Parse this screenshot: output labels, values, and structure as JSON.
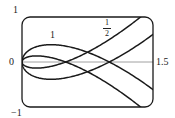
{
  "chart_data": {
    "type": "line",
    "title": "",
    "xlabel": "",
    "ylabel": "",
    "xlim": [
      0,
      1.5
    ],
    "ylim": [
      -1,
      1
    ],
    "grid": false,
    "axis_tick_labels": {
      "y_top": "1",
      "y_bottom": "-1",
      "x_left": "0",
      "x_right": "1.5"
    },
    "parametric_form": "x = t^2, y = t^3 - c t",
    "series": [
      {
        "name": "1",
        "c": 1,
        "label_text": "1",
        "x_axis_crossing": 1.0
      },
      {
        "name": "1/2",
        "c": 0.5,
        "label_text": "1/2",
        "label_num": "1",
        "label_den": "2",
        "x_axis_crossing": 0.5
      }
    ],
    "line_color": "#1a1a1a",
    "axis_color": "#888888"
  },
  "labels": {
    "y_top": "1",
    "y_bottom": "−1",
    "x_left": "0",
    "x_right": "1.5",
    "curve_1": "1",
    "curve_half_num": "1",
    "curve_half_den": "2"
  }
}
